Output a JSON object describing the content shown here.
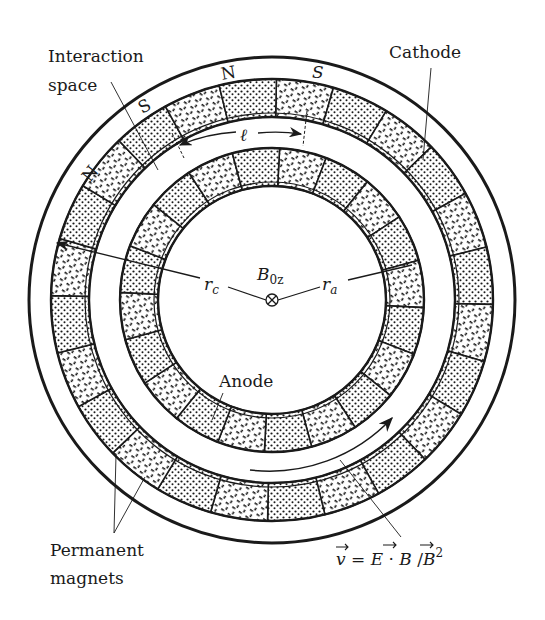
{
  "figure": {
    "type": "magnetron cross-section diagram",
    "center": {
      "x": 272,
      "y": 300
    },
    "colors": {
      "ink": "#1a1a1a",
      "background": "#ffffff"
    }
  },
  "labels": {
    "interaction_space_line1": "Interaction",
    "interaction_space_line2": "space",
    "cathode": "Cathode",
    "anode": "Anode",
    "permanent_magnets_line1": "Permanent",
    "permanent_magnets_line2": "magnets",
    "field": "B",
    "field_sub": "0z",
    "rc": "r",
    "rc_sub": "c",
    "ra": "r",
    "ra_sub": "a",
    "ell": "ℓ",
    "pole_n_left": "N",
    "pole_s_left": "S",
    "pole_n_top": "N",
    "pole_s_top": "S",
    "velocity_eq": {
      "v": "v",
      "eq": " = ",
      "E": "E",
      "dot": " · ",
      "B": "B",
      "slash": " /",
      "B2": "B",
      "exp": "2"
    }
  },
  "geometry": {
    "outer_circle_r": 243,
    "outer_ring": {
      "r_out": 221,
      "r_in": 183,
      "segments": 24
    },
    "inner_ring": {
      "r_out": 152,
      "r_in": 114,
      "segments": 20
    }
  }
}
